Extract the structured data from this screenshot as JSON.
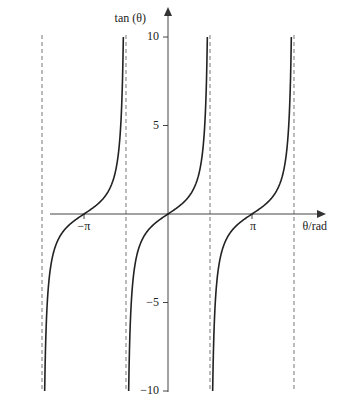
{
  "chart_data": {
    "type": "line",
    "title": "",
    "xlabel": "θ/rad",
    "ylabel": "tan (θ)",
    "function": "tan(θ)",
    "xlim": [
      -4.7,
      4.7
    ],
    "ylim": [
      -10,
      10
    ],
    "x_ticks": [
      {
        "value": -3.14159,
        "label": "−π"
      },
      {
        "value": 3.14159,
        "label": "π"
      }
    ],
    "y_ticks": [
      {
        "value": 10,
        "label": "10"
      },
      {
        "value": 5,
        "label": "5"
      },
      {
        "value": -5,
        "label": "−5"
      },
      {
        "value": -10,
        "label": "−10"
      }
    ],
    "asymptotes": [
      -4.712,
      -1.571,
      1.571,
      4.712
    ],
    "grid": false,
    "series": [
      {
        "name": "tan(θ)",
        "branches": [
          [
            -4.712,
            -1.571
          ],
          [
            -1.571,
            1.571
          ],
          [
            1.571,
            4.712
          ]
        ]
      }
    ]
  },
  "labels": {
    "ylabel": "tan (θ)",
    "xlabel": "θ/rad",
    "y10": "10",
    "y5": "5",
    "ym5": "−5",
    "ym10": "−10",
    "xmpi": "−π",
    "xpi": "π"
  }
}
